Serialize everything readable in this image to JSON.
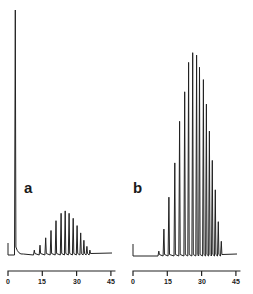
{
  "chart_data": [
    {
      "type": "line",
      "panel_label": "a",
      "title": "",
      "xlabel": "",
      "ylabel": "",
      "x_ticks": [
        0,
        15,
        30,
        45
      ],
      "xlim": [
        0,
        47
      ],
      "grid": false,
      "legend": null,
      "solvent_peak": {
        "x": 3.2,
        "relative_height": 1.0
      },
      "peaks": [
        {
          "x": 11.5,
          "relative_height": 0.02
        },
        {
          "x": 14.0,
          "relative_height": 0.04
        },
        {
          "x": 16.5,
          "relative_height": 0.07
        },
        {
          "x": 18.8,
          "relative_height": 0.1
        },
        {
          "x": 21.0,
          "relative_height": 0.14
        },
        {
          "x": 23.2,
          "relative_height": 0.17
        },
        {
          "x": 25.0,
          "relative_height": 0.18
        },
        {
          "x": 26.7,
          "relative_height": 0.17
        },
        {
          "x": 28.5,
          "relative_height": 0.15
        },
        {
          "x": 30.2,
          "relative_height": 0.12
        },
        {
          "x": 31.8,
          "relative_height": 0.09
        },
        {
          "x": 33.2,
          "relative_height": 0.06
        },
        {
          "x": 34.5,
          "relative_height": 0.035
        },
        {
          "x": 35.8,
          "relative_height": 0.02
        }
      ]
    },
    {
      "type": "line",
      "panel_label": "b",
      "title": "",
      "xlabel": "",
      "ylabel": "",
      "x_ticks": [
        0,
        15,
        30,
        45
      ],
      "xlim": [
        0,
        47
      ],
      "grid": false,
      "legend": null,
      "peaks": [
        {
          "x": 11.3,
          "relative_height": 0.02
        },
        {
          "x": 13.5,
          "relative_height": 0.11
        },
        {
          "x": 15.7,
          "relative_height": 0.24
        },
        {
          "x": 18.3,
          "relative_height": 0.38
        },
        {
          "x": 20.4,
          "relative_height": 0.55
        },
        {
          "x": 22.6,
          "relative_height": 0.67
        },
        {
          "x": 24.3,
          "relative_height": 0.79
        },
        {
          "x": 26.1,
          "relative_height": 0.83
        },
        {
          "x": 27.8,
          "relative_height": 0.82
        },
        {
          "x": 29.1,
          "relative_height": 0.77
        },
        {
          "x": 30.8,
          "relative_height": 0.72
        },
        {
          "x": 32.1,
          "relative_height": 0.62
        },
        {
          "x": 33.4,
          "relative_height": 0.51
        },
        {
          "x": 34.7,
          "relative_height": 0.39
        },
        {
          "x": 36.0,
          "relative_height": 0.27
        },
        {
          "x": 37.3,
          "relative_height": 0.14
        },
        {
          "x": 38.6,
          "relative_height": 0.06
        }
      ]
    }
  ],
  "figure": {
    "panel_a": {
      "label": "a",
      "ticks": [
        "0",
        "15",
        "30",
        "45"
      ]
    },
    "panel_b": {
      "label": "b",
      "ticks": [
        "0",
        "15",
        "30",
        "45"
      ]
    }
  }
}
